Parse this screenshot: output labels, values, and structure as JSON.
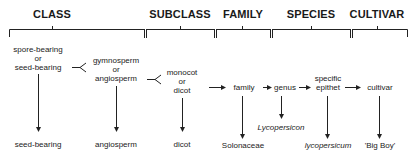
{
  "headers": {
    "class": "CLASS",
    "subclass": "SUBCLASS",
    "family": "FAMILY",
    "species": "SPECIES",
    "cultivar": "CULTIVAR"
  },
  "choices": {
    "class_line1": "spore-bearing",
    "class_line2": "or",
    "class_line3": "seed-bearing",
    "gymno_line1": "gymnosperm",
    "gymno_line2": "or",
    "gymno_line3": "angiosperm",
    "mono_line1": "monocot",
    "mono_line2": "or",
    "mono_line3": "dicot"
  },
  "chain": {
    "family": "family",
    "genus": "genus",
    "epithet_line1": "specific",
    "epithet_line2": "epithet",
    "cultivar": "cultivar"
  },
  "results": {
    "seed_bearing": "seed-bearing",
    "angiosperm": "angiosperm",
    "dicot": "dicot",
    "family": "Solonaceae",
    "genus": "Lycopersicon",
    "species": "lycopersicum",
    "cultivar": "'Big Boy'"
  },
  "colors": {
    "line": "#222222",
    "text": "#1a1a1a",
    "background": "#ffffff"
  }
}
